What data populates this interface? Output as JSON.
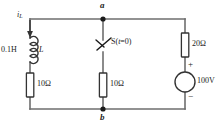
{
  "diagram": {
    "nodes": [
      {
        "id": "a",
        "label": "a",
        "position": "top-middle"
      },
      {
        "id": "b",
        "label": "b",
        "position": "bottom-middle"
      }
    ],
    "branches": {
      "left": {
        "current_label": "i",
        "current_sub": "L",
        "current_direction": "down",
        "inductor_value": "0.1H",
        "inductor_symbol": "L",
        "resistor_value": "10Ω"
      },
      "middle": {
        "switch_label": "S(",
        "switch_var": "t",
        "switch_cond": "=0)",
        "switch_full": "S(t=0)",
        "switch_state": "open",
        "resistor_value": "10Ω"
      },
      "right": {
        "resistor_value": "20Ω",
        "source_value": "100V",
        "source_plus": "+",
        "source_minus": "−",
        "source_type": "dc-voltage-source"
      }
    },
    "colors": {
      "wire": "#6e6e6e",
      "component_outline": "#333333",
      "text": "#222222",
      "background": "#ffffff"
    }
  }
}
